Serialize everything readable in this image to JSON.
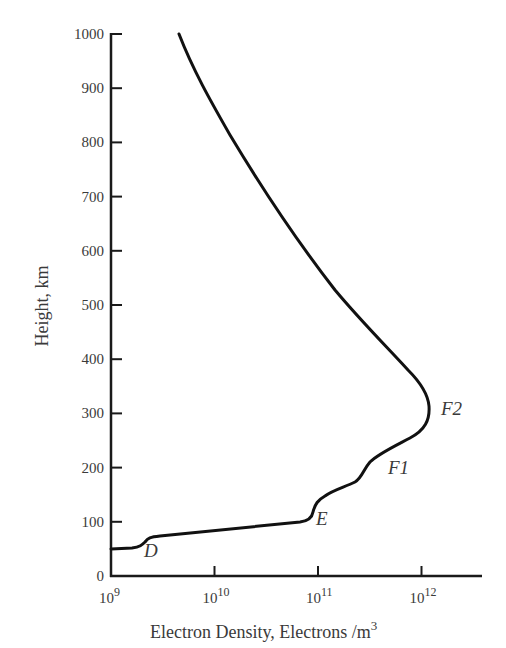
{
  "chart_data": {
    "type": "line",
    "title": "",
    "xlabel": "Electron Density, Electrons /m",
    "xlabel_superscript": "3",
    "ylabel": "Height, km",
    "xscale": "log",
    "xlim": [
      1000000000.0,
      4000000000000.0
    ],
    "ylim": [
      0,
      1000
    ],
    "grid": false,
    "legend": null,
    "y_ticks": [
      "0",
      "100",
      "200",
      "300",
      "400",
      "500",
      "600",
      "700",
      "800",
      "900",
      "1000"
    ],
    "x_ticks": [
      {
        "base": "10",
        "exp": "9"
      },
      {
        "base": "10",
        "exp": "10"
      },
      {
        "base": "10",
        "exp": "11"
      },
      {
        "base": "10",
        "exp": "12"
      }
    ],
    "series": [
      {
        "name": "Electron density profile",
        "x": [
          1000000000.0,
          1600000000.0,
          1900000000.0,
          2200000000.0,
          5000000000.0,
          20000000000.0,
          60000000000.0,
          80000000000.0,
          90000000000.0,
          100000000000.0,
          140000000000.0,
          230000000000.0,
          280000000000.0,
          330000000000.0,
          500000000000.0,
          900000000000.0,
          1150000000000.0,
          1200000000000.0,
          1170000000000.0,
          900000000000.0,
          600000000000.0,
          250000000000.0,
          70000000000.0,
          16000000000.0,
          4500000000.0
        ],
        "y": [
          50,
          55,
          65,
          72,
          76,
          82,
          91,
          96,
          105,
          130,
          150,
          170,
          185,
          205,
          230,
          260,
          285,
          310,
          340,
          380,
          430,
          540,
          700,
          860,
          1000
        ]
      }
    ],
    "annotations": [
      {
        "text": "D",
        "x": 2600000000.0,
        "y": 40
      },
      {
        "text": "E",
        "x": 105000000000.0,
        "y": 110
      },
      {
        "text": "F1",
        "x": 360000000000.0,
        "y": 210
      },
      {
        "text": "F2",
        "x": 1500000000000.0,
        "y": 300
      }
    ]
  },
  "colors": {
    "curve": "#111111",
    "axis": "#1a1a1a",
    "text": "#3a3a3a"
  }
}
